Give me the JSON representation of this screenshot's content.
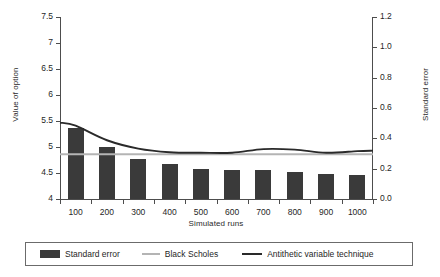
{
  "chart_data": {
    "type": "bar",
    "title": "",
    "subtitle": "",
    "xlabel": "Simulated runs",
    "ylabel": "Value of option",
    "y2label": "Standard error",
    "categories": [
      "100",
      "200",
      "300",
      "400",
      "500",
      "600",
      "700",
      "800",
      "900",
      "1000"
    ],
    "ylim": [
      4,
      7.5
    ],
    "y2lim": [
      0.0,
      1.2
    ],
    "yticks": [
      "4",
      "4.5",
      "5",
      "5.5",
      "6",
      "6.5",
      "7",
      "7.5"
    ],
    "ytick_values": [
      4,
      4.5,
      5,
      5.5,
      6,
      6.5,
      7,
      7.5
    ],
    "y2ticks": [
      "0.0",
      "0.2",
      "0.4",
      "0.6",
      "0.8",
      "1.0",
      "1.2"
    ],
    "y2tick_values": [
      0.0,
      0.2,
      0.4,
      0.6,
      0.8,
      1.0,
      1.2
    ],
    "grid": false,
    "legend_position": "bottom",
    "series": [
      {
        "name": "Standard error",
        "type": "bar",
        "axis": "y2",
        "color": "#3a3a3a",
        "values": [
          0.47,
          0.34,
          0.265,
          0.232,
          0.198,
          0.192,
          0.192,
          0.178,
          0.165,
          0.159
        ]
      },
      {
        "name": "Black Scholes",
        "type": "line",
        "axis": "y1",
        "color": "#b4b4b4",
        "values": [
          4.86,
          4.86,
          4.86,
          4.86,
          4.86,
          4.86,
          4.86,
          4.86,
          4.86,
          4.86
        ]
      },
      {
        "name": "Antithetic variable technique",
        "type": "line",
        "axis": "y1",
        "color": "#2a2a2a",
        "values": [
          5.41,
          5.13,
          4.97,
          4.9,
          4.89,
          4.89,
          4.96,
          4.95,
          4.89,
          4.92
        ]
      }
    ]
  },
  "legend": {
    "items": [
      {
        "label": "Standard error",
        "icon": "bar-swatch",
        "color": "#3a3a3a"
      },
      {
        "label": "Black Scholes",
        "icon": "line-swatch-light",
        "color": "#b4b4b4"
      },
      {
        "label": "Antithetic variable technique",
        "icon": "line-swatch-dark",
        "color": "#2a2a2a"
      }
    ]
  }
}
